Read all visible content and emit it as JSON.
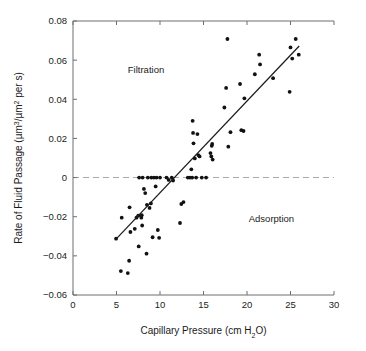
{
  "chart_data": {
    "type": "scatter",
    "title": "",
    "xlabel": "Capillary Pressure (cm H2O)",
    "xlabel_parts": {
      "main": "Capillary Pressure (cm H",
      "sub": "2",
      "tail": "O)"
    },
    "ylabel": "Rate of Fluid Passage (µm3/µm2 per s)",
    "ylabel_parts": {
      "a": "Rate of Fluid Passage (µm",
      "sup1": "3",
      "b": "/µm",
      "sup2": "2",
      "c": " per s)"
    },
    "xlim": [
      0,
      30
    ],
    "ylim": [
      -0.06,
      0.08
    ],
    "xticks": [
      0,
      5,
      10,
      15,
      20,
      25,
      30
    ],
    "xtick_labels": [
      "0",
      "5",
      "10",
      "15",
      "20",
      "25",
      "30"
    ],
    "yticks": [
      -0.06,
      -0.04,
      -0.02,
      0,
      0.02,
      0.04,
      0.06,
      0.08
    ],
    "ytick_labels": [
      "−0.06",
      "−0.04",
      "−0.02",
      "0",
      "0.02",
      "0.04",
      "0.06",
      "0.08"
    ],
    "grid": false,
    "legend": "none",
    "marker": "filled-circle",
    "marker_color": "#111111",
    "point_color": "#111111",
    "line_color": "#1b1b1b",
    "zero_line_color": "#a8a8a8",
    "axis_color": "#6f6f6f",
    "annotations": [
      {
        "text": "Filtration",
        "x": 6.3,
        "y": 0.0535
      },
      {
        "text": "Adsorption",
        "x": 20.2,
        "y": -0.0225
      }
    ],
    "trend_line": {
      "label": "regression-line",
      "x": [
        5.0,
        26.0
      ],
      "y": [
        -0.0312,
        0.0672
      ]
    },
    "zero_reference_line": {
      "y": 0
    },
    "points": [
      [
        4.95,
        -0.0312
      ],
      [
        5.5,
        -0.0478
      ],
      [
        5.6,
        -0.0205
      ],
      [
        6.3,
        -0.0488
      ],
      [
        6.45,
        -0.0425
      ],
      [
        6.5,
        -0.0152
      ],
      [
        6.6,
        -0.0278
      ],
      [
        7.1,
        -0.0262
      ],
      [
        7.3,
        -0.0205
      ],
      [
        7.5,
        -0.0194
      ],
      [
        7.55,
        -0.0352
      ],
      [
        7.6,
        0.0
      ],
      [
        7.85,
        -0.0205
      ],
      [
        7.9,
        -0.0192
      ],
      [
        7.95,
        -0.0245
      ],
      [
        8.0,
        0.0
      ],
      [
        8.15,
        -0.0058
      ],
      [
        8.3,
        -0.0079
      ],
      [
        8.45,
        -0.0389
      ],
      [
        8.5,
        -0.0139
      ],
      [
        8.6,
        0.0
      ],
      [
        8.8,
        -0.0155
      ],
      [
        8.95,
        -0.0132
      ],
      [
        9.0,
        0.0
      ],
      [
        9.15,
        -0.0305
      ],
      [
        9.3,
        0.0
      ],
      [
        9.5,
        -0.0045
      ],
      [
        9.6,
        0.0
      ],
      [
        9.75,
        -0.0268
      ],
      [
        9.9,
        -0.0308
      ],
      [
        10.0,
        0.0
      ],
      [
        10.75,
        0.0
      ],
      [
        11.0,
        -0.0012
      ],
      [
        11.35,
        0.0
      ],
      [
        11.5,
        -0.0015
      ],
      [
        12.3,
        -0.0232
      ],
      [
        12.45,
        -0.0135
      ],
      [
        12.7,
        -0.0125
      ],
      [
        13.2,
        0.0
      ],
      [
        13.45,
        0.0
      ],
      [
        13.6,
        0.0042
      ],
      [
        13.7,
        0.0
      ],
      [
        13.75,
        0.029
      ],
      [
        13.8,
        0.0228
      ],
      [
        13.85,
        0.0175
      ],
      [
        14.0,
        0.0098
      ],
      [
        14.15,
        0.0
      ],
      [
        14.3,
        0.0222
      ],
      [
        14.4,
        0.0115
      ],
      [
        14.55,
        0.0108
      ],
      [
        14.8,
        0.0
      ],
      [
        15.3,
        0.0
      ],
      [
        15.8,
        0.0125
      ],
      [
        15.9,
        0.0108
      ],
      [
        15.95,
        0.0162
      ],
      [
        16.0,
        0.0172
      ],
      [
        16.05,
        0.0092
      ],
      [
        17.4,
        0.0358
      ],
      [
        17.6,
        0.0458
      ],
      [
        17.75,
        0.0708
      ],
      [
        17.85,
        0.0158
      ],
      [
        18.1,
        0.0232
      ],
      [
        19.2,
        0.0478
      ],
      [
        19.35,
        0.0242
      ],
      [
        19.6,
        0.0238
      ],
      [
        19.7,
        0.0405
      ],
      [
        20.9,
        0.0528
      ],
      [
        21.4,
        0.0628
      ],
      [
        21.5,
        0.0578
      ],
      [
        23.0,
        0.0508
      ],
      [
        24.9,
        0.0438
      ],
      [
        25.0,
        0.0665
      ],
      [
        25.2,
        0.0608
      ],
      [
        25.6,
        0.0708
      ],
      [
        25.95,
        0.0628
      ]
    ]
  }
}
